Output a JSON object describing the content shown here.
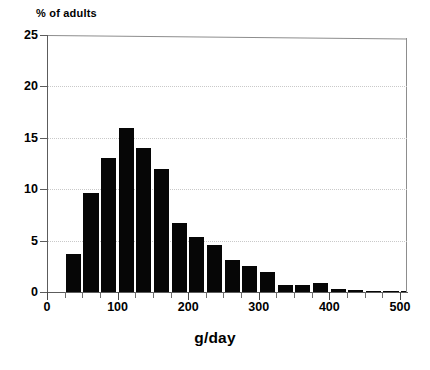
{
  "chart_data": {
    "type": "bar",
    "title": "",
    "subtitle": "",
    "xlabel": "g/day",
    "ylabel": "% of adults",
    "ylabel_position": "top-left",
    "grid": "horizontal-dotted",
    "legend": "none",
    "bar_color": "#060606",
    "axis_color": "#5c5c5c",
    "grid_color": "#c9c9c9",
    "xlim": [
      0,
      510
    ],
    "ylim": [
      0,
      25
    ],
    "bin_width": 25,
    "x_ticks": [
      0,
      100,
      200,
      300,
      400,
      500
    ],
    "x_tick_labels": [
      "0",
      "100",
      "200",
      "300",
      "400",
      "500"
    ],
    "x_minor_tick_step": 25,
    "y_ticks": [
      0,
      5,
      10,
      15,
      20,
      25
    ],
    "y_tick_labels": [
      "0",
      "5",
      "10",
      "15",
      "20",
      "25"
    ],
    "categories": [
      "25-50",
      "50-75",
      "75-100",
      "100-125",
      "125-150",
      "150-175",
      "175-200",
      "200-225",
      "225-250",
      "250-275",
      "275-300",
      "300-325",
      "325-350",
      "350-375",
      "375-400",
      "400-425",
      "425-450",
      "450-475",
      "475-500",
      "500-510"
    ],
    "bin_starts": [
      25,
      50,
      75,
      100,
      125,
      150,
      175,
      200,
      225,
      250,
      275,
      300,
      325,
      350,
      375,
      400,
      425,
      450,
      475,
      500
    ],
    "values": [
      3.7,
      9.6,
      13.0,
      16.0,
      14.0,
      12.0,
      6.7,
      5.4,
      4.6,
      3.1,
      2.5,
      1.9,
      0.7,
      0.65,
      0.9,
      0.25,
      0.2,
      0.1,
      0.08,
      0.08
    ]
  }
}
